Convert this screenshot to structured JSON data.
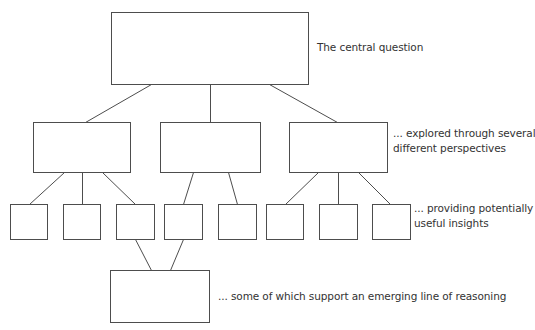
{
  "labels": {
    "level1": "The central question",
    "level2_line1": "... explored through several",
    "level2_line2": "different perspectives",
    "level3_line1": "... providing potentially",
    "level3_line2": "useful insights",
    "level4": "... some of which support an emerging line of reasoning"
  },
  "colors": {
    "stroke": "#4d4d4d",
    "text": "#333333",
    "background": "#ffffff"
  },
  "nodes": [
    {
      "id": "central-question",
      "level": 1,
      "x": 111,
      "y": 12,
      "w": 197,
      "h": 72
    },
    {
      "id": "perspective-1",
      "level": 2,
      "x": 33,
      "y": 122,
      "w": 97,
      "h": 50
    },
    {
      "id": "perspective-2",
      "level": 2,
      "x": 160,
      "y": 122,
      "w": 100,
      "h": 50
    },
    {
      "id": "perspective-3",
      "level": 2,
      "x": 289,
      "y": 122,
      "w": 98,
      "h": 50
    },
    {
      "id": "insight-1",
      "level": 3,
      "x": 10,
      "y": 204,
      "w": 37,
      "h": 35
    },
    {
      "id": "insight-2",
      "level": 3,
      "x": 63,
      "y": 204,
      "w": 37,
      "h": 35
    },
    {
      "id": "insight-3",
      "level": 3,
      "x": 116,
      "y": 204,
      "w": 38,
      "h": 35
    },
    {
      "id": "insight-4",
      "level": 3,
      "x": 164,
      "y": 204,
      "w": 38,
      "h": 35
    },
    {
      "id": "insight-5",
      "level": 3,
      "x": 218,
      "y": 204,
      "w": 38,
      "h": 35
    },
    {
      "id": "insight-6",
      "level": 3,
      "x": 266,
      "y": 204,
      "w": 37,
      "h": 35
    },
    {
      "id": "insight-7",
      "level": 3,
      "x": 319,
      "y": 204,
      "w": 38,
      "h": 35
    },
    {
      "id": "insight-8",
      "level": 3,
      "x": 372,
      "y": 204,
      "w": 38,
      "h": 35
    },
    {
      "id": "line-of-reasoning",
      "level": 4,
      "x": 110,
      "y": 270,
      "w": 99,
      "h": 52
    }
  ],
  "edges": [
    {
      "from": "central-question",
      "to": "perspective-1"
    },
    {
      "from": "central-question",
      "to": "perspective-2"
    },
    {
      "from": "central-question",
      "to": "perspective-3"
    },
    {
      "from": "perspective-1",
      "to": "insight-1"
    },
    {
      "from": "perspective-1",
      "to": "insight-2"
    },
    {
      "from": "perspective-1",
      "to": "insight-3"
    },
    {
      "from": "perspective-2",
      "to": "insight-4"
    },
    {
      "from": "perspective-2",
      "to": "insight-5"
    },
    {
      "from": "perspective-3",
      "to": "insight-6"
    },
    {
      "from": "perspective-3",
      "to": "insight-7"
    },
    {
      "from": "perspective-3",
      "to": "insight-8"
    },
    {
      "from": "insight-3",
      "to": "line-of-reasoning"
    },
    {
      "from": "insight-4",
      "to": "line-of-reasoning"
    }
  ]
}
